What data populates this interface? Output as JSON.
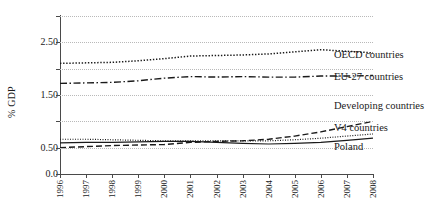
{
  "chart_data": {
    "type": "line",
    "title": "",
    "xlabel": "",
    "ylabel": "% GDP",
    "x": [
      1996,
      1997,
      1998,
      1999,
      2000,
      2001,
      2002,
      2003,
      2004,
      2005,
      2006,
      2007,
      2008
    ],
    "xtick_labels": [
      "1996",
      "1997",
      "1998",
      "1999",
      "2000",
      "2001",
      "2002",
      "2003",
      "2004",
      "2005",
      "2006",
      "2007",
      "2008"
    ],
    "ytick_labels": [
      "0.0",
      "0.50",
      "1.50",
      "2.50"
    ],
    "ytick_values": [
      0.0,
      0.5,
      1.5,
      2.5
    ],
    "ylim": [
      0.0,
      3.0
    ],
    "xlim": [
      1996,
      2008
    ],
    "grid": "horizontal-dotted",
    "legend": "inline-right-labels",
    "series": [
      {
        "name": "OECD countries",
        "style": "dotted",
        "color": "#1a1a1a",
        "values": [
          2.1,
          2.11,
          2.12,
          2.15,
          2.19,
          2.24,
          2.25,
          2.26,
          2.28,
          2.32,
          2.36,
          2.33,
          2.3
        ]
      },
      {
        "name": "EU-27 countries",
        "style": "dash-dot",
        "color": "#1a1a1a",
        "values": [
          1.72,
          1.73,
          1.74,
          1.77,
          1.82,
          1.85,
          1.84,
          1.85,
          1.84,
          1.84,
          1.86,
          1.86,
          1.87
        ]
      },
      {
        "name": "Developing countries",
        "style": "dashed",
        "color": "#1a1a1a",
        "values": [
          0.5,
          0.52,
          0.54,
          0.55,
          0.56,
          0.6,
          0.62,
          0.63,
          0.66,
          0.72,
          0.8,
          0.9,
          1.0
        ]
      },
      {
        "name": "V4 countries",
        "style": "dotted-fine",
        "color": "#1a1a1a",
        "values": [
          0.66,
          0.66,
          0.65,
          0.64,
          0.63,
          0.63,
          0.63,
          0.63,
          0.63,
          0.65,
          0.68,
          0.72,
          0.76
        ]
      },
      {
        "name": "Poland",
        "style": "solid",
        "color": "#1a1a1a",
        "values": [
          0.59,
          0.6,
          0.6,
          0.61,
          0.62,
          0.62,
          0.6,
          0.58,
          0.57,
          0.58,
          0.6,
          0.64,
          0.68
        ]
      }
    ],
    "series_labels": [
      {
        "text": "OECD countries",
        "x": 334,
        "y": 49
      },
      {
        "text": "EU-27 countries",
        "x": 334,
        "y": 71
      },
      {
        "text": "Developing countries",
        "x": 334,
        "y": 100
      },
      {
        "text": "V4 countries",
        "x": 334,
        "y": 122
      },
      {
        "text": "Poland",
        "x": 334,
        "y": 141
      }
    ]
  }
}
